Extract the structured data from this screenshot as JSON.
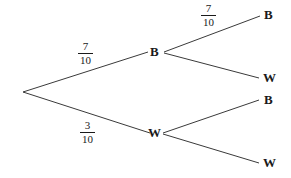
{
  "diagram": {
    "type": "probability-tree-diagram",
    "background_color": "#ffffff",
    "line_color": "#3a3a3a",
    "text_color": "#1a1a1a",
    "root": {
      "label": "",
      "x": 23,
      "y": 92
    },
    "level1": [
      {
        "id": "node-b1",
        "label": "B",
        "x": 155,
        "y": 52,
        "probability": {
          "numerator": "7",
          "denominator": "10",
          "x": 88,
          "y": 52
        }
      },
      {
        "id": "node-w1",
        "label": "W",
        "x": 154,
        "y": 133,
        "probability": {
          "numerator": "3",
          "denominator": "10",
          "x": 90,
          "y": 131
        }
      }
    ],
    "level2": [
      {
        "id": "node-b1-b2",
        "label": "B",
        "parent": "node-b1",
        "x": 268,
        "y": 15,
        "probability": {
          "numerator": "7",
          "denominator": "10",
          "x": 210,
          "y": 14
        }
      },
      {
        "id": "node-b1-w2",
        "label": "W",
        "parent": "node-b1",
        "x": 268,
        "y": 78,
        "probability": null
      },
      {
        "id": "node-w1-b2",
        "label": "B",
        "parent": "node-w1",
        "x": 268,
        "y": 100,
        "probability": null
      },
      {
        "id": "node-w1-w2",
        "label": "W",
        "parent": "node-w1",
        "x": 268,
        "y": 163,
        "probability": null
      }
    ],
    "edges": [
      {
        "id": "edge-root-b1",
        "x1": 23,
        "y1": 92,
        "x2": 148,
        "y2": 52
      },
      {
        "id": "edge-root-w1",
        "x1": 23,
        "y1": 92,
        "x2": 150,
        "y2": 133
      },
      {
        "id": "edge-b1-b2",
        "x1": 164,
        "y1": 52,
        "x2": 260,
        "y2": 16
      },
      {
        "id": "edge-b1-w2",
        "x1": 164,
        "y1": 53,
        "x2": 259,
        "y2": 78
      },
      {
        "id": "edge-w1-b2",
        "x1": 163,
        "y1": 133,
        "x2": 259,
        "y2": 100
      },
      {
        "id": "edge-w1-w2",
        "x1": 163,
        "y1": 134,
        "x2": 259,
        "y2": 163
      }
    ]
  }
}
